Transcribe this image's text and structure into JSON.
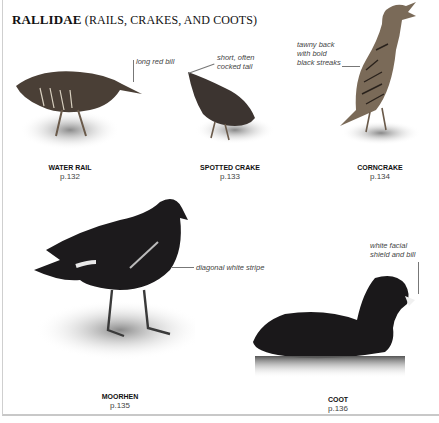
{
  "section": {
    "family": "RALLIDAE",
    "common": "(RAILS, CRAKES, AND COOTS)"
  },
  "birds": [
    {
      "name": "WATER RAIL",
      "page": "p.132",
      "annotation": "long red bill",
      "icon": "water-rail-illustration"
    },
    {
      "name": "SPOTTED CRAKE",
      "page": "p.133",
      "annotation": "short, often\ncocked tail",
      "icon": "spotted-crake-illustration"
    },
    {
      "name": "CORNCRAKE",
      "page": "p.134",
      "annotation": "tawny back\nwith bold\nblack streaks",
      "icon": "corncrake-illustration"
    },
    {
      "name": "MOORHEN",
      "page": "p.135",
      "annotation": "diagonal white stripe",
      "icon": "moorhen-illustration"
    },
    {
      "name": "COOT",
      "page": "p.136",
      "annotation": "white facial\nshield and bill",
      "icon": "coot-illustration"
    }
  ],
  "colors": {
    "text": "#111111",
    "annotation": "#444444",
    "bird_dark": "#1c1a1c",
    "bird_brown": "#5a4a3a",
    "ground": "#9a9a9a"
  }
}
